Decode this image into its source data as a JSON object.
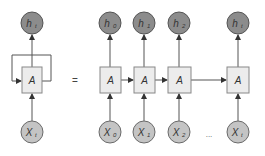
{
  "colors": {
    "output_fill": "#8c8c8c",
    "output_stroke": "#555555",
    "input_fill": "#c4c4c4",
    "input_stroke": "#6a6a6a",
    "cell_fill": "#ececec",
    "cell_stroke": "#888888",
    "line": "#555555",
    "text": "#333333"
  },
  "folded": {
    "output_label": "h",
    "output_sub": "t",
    "cell_label": "A",
    "input_label": "X",
    "input_sub": "t"
  },
  "equals": "=",
  "unrolled": [
    {
      "output_label": "h",
      "output_sub": "0",
      "cell_label": "A",
      "input_label": "X",
      "input_sub": "0"
    },
    {
      "output_label": "h",
      "output_sub": "1",
      "cell_label": "A",
      "input_label": "X",
      "input_sub": "1"
    },
    {
      "output_label": "h",
      "output_sub": "2",
      "cell_label": "A",
      "input_label": "X",
      "input_sub": "2"
    },
    {
      "output_label": "h",
      "output_sub": "t",
      "cell_label": "A",
      "input_label": "X",
      "input_sub": "t"
    }
  ],
  "ellipsis": "..."
}
